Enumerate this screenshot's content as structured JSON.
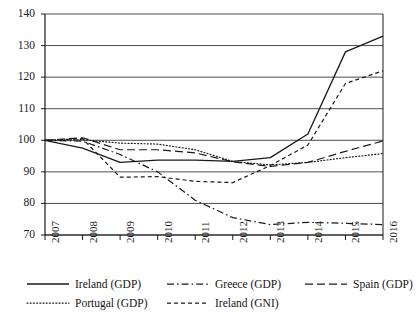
{
  "chart_data": {
    "type": "line",
    "title": "",
    "subtitle": "",
    "xlabel": "",
    "ylabel": "",
    "x": [
      "2007",
      "2008",
      "2009",
      "2010",
      "2011",
      "2012",
      "2013",
      "2014",
      "2015",
      "2016"
    ],
    "categories": [
      "2007",
      "2008",
      "2009",
      "2010",
      "2011",
      "2012",
      "2013",
      "2014",
      "2015",
      "2016"
    ],
    "xlim": [
      "2007",
      "2016"
    ],
    "ylim": [
      70,
      140
    ],
    "ytick_values": [
      70,
      80,
      90,
      100,
      110,
      120,
      130,
      140
    ],
    "ytick_labels": [
      "70",
      "80",
      "90",
      "100",
      "110",
      "120",
      "130",
      "140"
    ],
    "grid": true,
    "grid_axis": "y",
    "legend_position": "bottom",
    "line_color": "#1a1a1a",
    "grid_color": "#4d4d4d",
    "axis_color": "#1a1a1a",
    "series": [
      {
        "name": "Ireland (GDP)",
        "dash": "solid",
        "values": [
          100.0,
          97.5,
          93.0,
          93.7,
          93.7,
          93.3,
          94.5,
          102.0,
          128.0,
          133.0
        ]
      },
      {
        "name": "Greece (GDP)",
        "dash": "dashdot",
        "values": [
          100.0,
          99.7,
          95.5,
          90.0,
          81.0,
          75.5,
          73.3,
          74.0,
          73.7,
          73.3
        ]
      },
      {
        "name": "Spain (GDP)",
        "dash": "longdash",
        "values": [
          100.0,
          100.8,
          97.0,
          97.0,
          96.0,
          93.2,
          91.7,
          93.0,
          96.5,
          99.8
        ]
      },
      {
        "name": "Portugal (GDP)",
        "dash": "dotted",
        "values": [
          100.0,
          100.2,
          99.1,
          98.8,
          97.0,
          93.3,
          92.2,
          93.0,
          94.5,
          95.8
        ]
      },
      {
        "name": "Ireland (GNI)",
        "dash": "shortdash",
        "values": [
          100.0,
          100.5,
          88.3,
          88.5,
          87.0,
          86.6,
          92.0,
          98.5,
          118.0,
          122.0
        ]
      }
    ]
  },
  "legend": {
    "rows": [
      [
        {
          "label": "Ireland (GDP)",
          "dash": "solid"
        },
        {
          "label": "Greece (GDP)",
          "dash": "dashdot"
        },
        {
          "label": "Spain (GDP)",
          "dash": "longdash"
        }
      ],
      [
        {
          "label": "Portugal (GDP)",
          "dash": "dotted"
        },
        {
          "label": "Ireland (GNI)",
          "dash": "shortdash"
        }
      ]
    ]
  }
}
